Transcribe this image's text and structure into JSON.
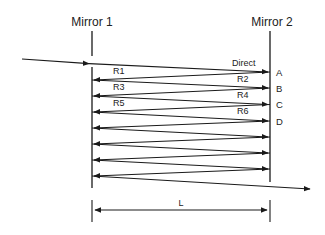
{
  "diagram": {
    "mirror1": {
      "label": "Mirror 1"
    },
    "mirror2": {
      "label": "Mirror 2"
    },
    "ray_labels": {
      "direct": "Direct",
      "r1": "R1",
      "r2": "R2",
      "r3": "R3",
      "r4": "R4",
      "r5": "R5",
      "r6": "R6"
    },
    "points": {
      "a": "A",
      "b": "B",
      "c": "C",
      "d": "D"
    },
    "distance": {
      "label": "L"
    },
    "colors": {
      "line": "#1a1a1a",
      "background": "#ffffff"
    }
  }
}
